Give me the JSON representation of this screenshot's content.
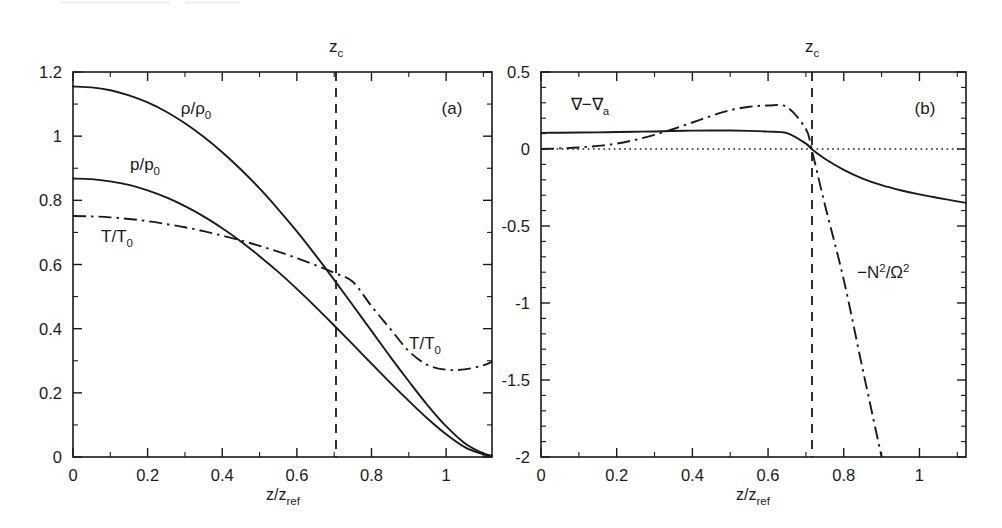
{
  "figure": {
    "background": "#ffffff",
    "ink": "#1a1a1a",
    "panels": [
      "a",
      "b"
    ]
  },
  "panel_a": {
    "label": "(a)",
    "xlabel_main": "z/z",
    "xlabel_sub": "ref",
    "xticklabels": [
      "0",
      "0.2",
      "0.4",
      "0.6",
      "0.8",
      "1"
    ],
    "yticklabels": [
      "0",
      "0.2",
      "0.4",
      "0.6",
      "0.8",
      "1",
      "1.2"
    ],
    "marker_label": "z",
    "marker_sub": "c",
    "curve_labels": {
      "rho": {
        "main": "ρ/ρ",
        "sub": "0"
      },
      "p": {
        "main": "p/p",
        "sub": "0"
      },
      "T": {
        "main": "T/T",
        "sub": "0"
      },
      "T_right": {
        "main": "T/T",
        "sub": "0"
      }
    }
  },
  "panel_b": {
    "label": "(b)",
    "xlabel_main": "z/z",
    "xlabel_sub": "ref",
    "xticklabels": [
      "0",
      "0.2",
      "0.4",
      "0.6",
      "0.8",
      "1"
    ],
    "yticklabels": [
      "0.5",
      "0",
      "-0.5",
      "-1",
      "-1.5",
      "-2"
    ],
    "marker_label": "z",
    "marker_sub": "c",
    "curve_labels": {
      "grad": {
        "main": "∇−∇",
        "sub": "a"
      },
      "nsq": {
        "pre": "−N",
        "sup1": "2",
        "mid": "/Ω",
        "sup2": "2"
      }
    }
  },
  "chart_data": [
    {
      "type": "line",
      "id": "panel-a",
      "title": "",
      "panel_label": "(a)",
      "xlabel": "z/z_ref",
      "ylabel": "",
      "xlim": [
        0,
        1.123
      ],
      "ylim": [
        0,
        1.2
      ],
      "xticks": [
        0,
        0.2,
        0.4,
        0.6,
        0.8,
        1
      ],
      "yticks": [
        0,
        0.2,
        0.4,
        0.6,
        0.8,
        1,
        1.2
      ],
      "minor_ticks_per_interval": 1,
      "grid": false,
      "legend": "inline-labels",
      "annotations": [
        {
          "text": "z_c",
          "x": 0.705,
          "type": "vertical-dashed-line"
        },
        {
          "text": "(a)",
          "x": 1.0,
          "y": 1.11,
          "type": "panel-label"
        }
      ],
      "x": [
        0,
        0.05,
        0.1,
        0.15,
        0.2,
        0.25,
        0.3,
        0.35,
        0.4,
        0.45,
        0.5,
        0.55,
        0.6,
        0.65,
        0.7,
        0.75,
        0.8,
        0.85,
        0.9,
        0.95,
        1.0,
        1.05,
        1.1,
        1.123
      ],
      "series": [
        {
          "name": "rho/rho_0",
          "style": "solid",
          "label_x": 0.33,
          "label_y": 1.02,
          "values": [
            1.155,
            1.152,
            1.143,
            1.127,
            1.105,
            1.076,
            1.04,
            0.998,
            0.95,
            0.896,
            0.837,
            0.772,
            0.703,
            0.629,
            0.552,
            0.473,
            0.393,
            0.313,
            0.236,
            0.162,
            0.096,
            0.043,
            0.011,
            0.004
          ]
        },
        {
          "name": "p/p_0",
          "style": "solid",
          "label_x": 0.2,
          "label_y": 0.855,
          "values": [
            0.868,
            0.866,
            0.859,
            0.848,
            0.831,
            0.809,
            0.782,
            0.75,
            0.713,
            0.672,
            0.626,
            0.577,
            0.524,
            0.468,
            0.41,
            0.351,
            0.291,
            0.232,
            0.175,
            0.12,
            0.071,
            0.031,
            0.008,
            0.003
          ]
        },
        {
          "name": "T/T_0",
          "style": "dash-dot",
          "label_x": 0.115,
          "label_y": 0.645,
          "label2_x": 0.905,
          "label2_y": 0.375,
          "values": [
            0.751,
            0.75,
            0.747,
            0.742,
            0.735,
            0.726,
            0.716,
            0.704,
            0.69,
            0.675,
            0.658,
            0.64,
            0.62,
            0.598,
            0.574,
            0.546,
            0.47,
            0.4,
            0.33,
            0.287,
            0.272,
            0.273,
            0.286,
            0.297
          ]
        }
      ]
    },
    {
      "type": "line",
      "id": "panel-b",
      "title": "",
      "panel_label": "(b)",
      "xlabel": "z/z_ref",
      "ylabel": "",
      "xlim": [
        0,
        1.123
      ],
      "ylim": [
        -2,
        0.5
      ],
      "xticks": [
        0,
        0.2,
        0.4,
        0.6,
        0.8,
        1
      ],
      "yticks": [
        0.5,
        0,
        -0.5,
        -1,
        -1.5,
        -2
      ],
      "minor_ticks_per_interval": 4,
      "grid": false,
      "legend": "inline-labels",
      "annotations": [
        {
          "text": "z_c",
          "x": 0.715,
          "type": "vertical-dashed-line"
        },
        {
          "text": "y=0",
          "y": 0,
          "type": "horizontal-dotted-line"
        },
        {
          "text": "(b)",
          "x": 1.0,
          "y": 0.37,
          "type": "panel-label"
        }
      ],
      "x": [
        0,
        0.05,
        0.1,
        0.15,
        0.2,
        0.25,
        0.3,
        0.35,
        0.4,
        0.45,
        0.5,
        0.55,
        0.6,
        0.65,
        0.7,
        0.715,
        0.75,
        0.8,
        0.85,
        0.9,
        0.95,
        1.0,
        1.05,
        1.1,
        1.123
      ],
      "series": [
        {
          "name": "grad - grad_a",
          "style": "solid",
          "label_x": 0.115,
          "label_y": 0.265,
          "values": [
            0.105,
            0.106,
            0.107,
            0.108,
            0.11,
            0.112,
            0.114,
            0.117,
            0.119,
            0.12,
            0.12,
            0.118,
            0.113,
            0.103,
            0.035,
            0.0,
            -0.063,
            -0.135,
            -0.192,
            -0.235,
            -0.268,
            -0.295,
            -0.318,
            -0.34,
            -0.35
          ]
        },
        {
          "name": "-N^2/Omega^2",
          "style": "dash-dot",
          "label_x": 0.83,
          "label_y": -0.8,
          "values": [
            0.0,
            0.004,
            0.01,
            0.02,
            0.035,
            0.06,
            0.092,
            0.13,
            0.172,
            0.215,
            0.252,
            0.274,
            0.282,
            0.272,
            0.13,
            0.0,
            -0.36,
            -0.85,
            -1.43,
            -2.0,
            null,
            null,
            null,
            null,
            null
          ]
        }
      ]
    }
  ]
}
